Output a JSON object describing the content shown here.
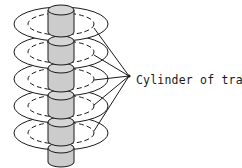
{
  "figure": {
    "background_color": "#ffffff",
    "line_color": "#1a1a1a",
    "platter_fill": "#ffffff",
    "hub_fill": "#cccccc",
    "hub_top_fill": "#d6d6d6",
    "width": 242,
    "height": 168
  },
  "annotation": {
    "label": "Cylinder of tracks",
    "label_x": 136,
    "label_y": 80,
    "leader_apex_x": 129,
    "leader_apex_y": 76,
    "leader_count": 5,
    "arrow": "leader-lines"
  },
  "platters": [
    {
      "index": 1,
      "cx": 61,
      "cy": 24,
      "rx": 47,
      "ry": 17,
      "track_rx": 33,
      "track_ry": 11,
      "leader_from_x": 94,
      "leader_from_y": 28
    },
    {
      "index": 2,
      "cx": 61,
      "cy": 52,
      "rx": 47,
      "ry": 17,
      "track_rx": 33,
      "track_ry": 11,
      "leader_from_x": 94,
      "leader_from_y": 55
    },
    {
      "index": 3,
      "cx": 61,
      "cy": 79,
      "rx": 47,
      "ry": 17,
      "track_rx": 33,
      "track_ry": 11,
      "leader_from_x": 94,
      "leader_from_y": 80
    },
    {
      "index": 4,
      "cx": 61,
      "cy": 106,
      "rx": 47,
      "ry": 17,
      "track_rx": 33,
      "track_ry": 11,
      "leader_from_x": 94,
      "leader_from_y": 105
    },
    {
      "index": 5,
      "cx": 61,
      "cy": 133,
      "rx": 47,
      "ry": 17,
      "track_rx": 33,
      "track_ry": 11,
      "leader_from_x": 94,
      "leader_from_y": 131
    }
  ],
  "hubs": [
    {
      "index": 1,
      "cx": 61,
      "top_y": 10,
      "bottom_y": 32,
      "rx": 13,
      "ry": 5
    },
    {
      "index": 2,
      "cx": 61,
      "top_y": 41,
      "bottom_y": 60,
      "rx": 13,
      "ry": 5
    },
    {
      "index": 3,
      "cx": 61,
      "top_y": 68,
      "bottom_y": 87,
      "rx": 13,
      "ry": 5
    },
    {
      "index": 4,
      "cx": 61,
      "top_y": 95,
      "bottom_y": 114,
      "rx": 13,
      "ry": 5
    },
    {
      "index": 5,
      "cx": 61,
      "top_y": 122,
      "bottom_y": 141,
      "rx": 13,
      "ry": 5
    },
    {
      "index": 6,
      "cx": 61,
      "top_y": 148,
      "bottom_y": 162,
      "rx": 13,
      "ry": 5
    }
  ]
}
